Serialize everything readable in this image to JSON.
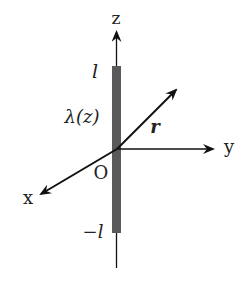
{
  "diagram": {
    "colors": {
      "rod": "#5a5a5a",
      "line": "#111111",
      "background": "#ffffff"
    },
    "axes": {
      "z_label": "z",
      "y_label": "y",
      "x_label": "x",
      "origin_label": "O"
    },
    "rod": {
      "top_label": "l",
      "bottom_label": "−l",
      "density_label": "λ(z)"
    },
    "vector": {
      "label": "r"
    }
  }
}
